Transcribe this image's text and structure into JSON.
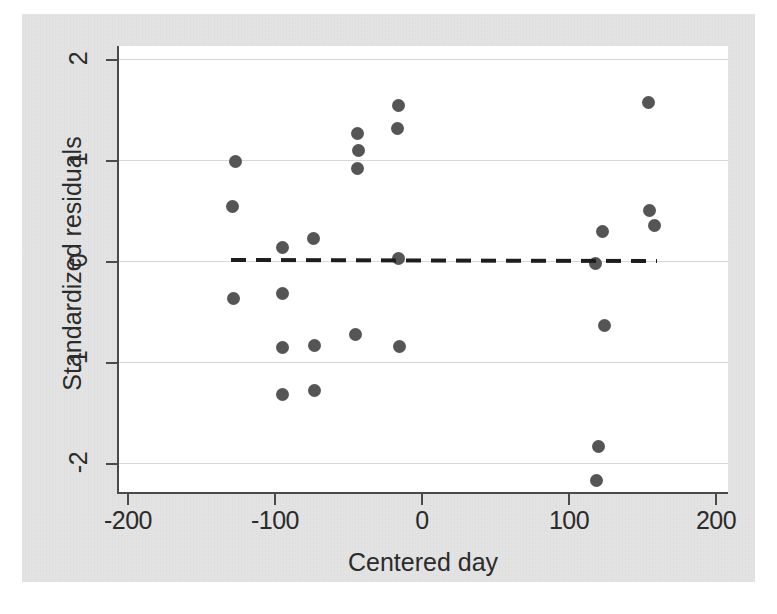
{
  "chart_data": {
    "type": "scatter",
    "title": "",
    "xlabel": "Centered day",
    "ylabel": "Standardized residuals",
    "xlim": [
      -220,
      207
    ],
    "ylim": [
      -2.33,
      2.16
    ],
    "xticks": [
      -200,
      -100,
      0,
      100,
      200
    ],
    "xticklabels": [
      "-200",
      "-100",
      "0",
      "100",
      "200"
    ],
    "yticks": [
      -2,
      -1,
      0,
      1,
      2
    ],
    "yticklabels": [
      "-2",
      "-1",
      "0",
      "1",
      "2"
    ],
    "grid": "horizontal-only",
    "legend": "none",
    "marker_color": "#555555",
    "grid_color": "#d8d8d8",
    "axis_color": "#4a4a4a",
    "panel_color": "#ffffff",
    "background_color": "#e4e4e4",
    "points": [
      {
        "x": -129,
        "y": 0.55
      },
      {
        "x": -127,
        "y": 0.99
      },
      {
        "x": -128,
        "y": -0.36
      },
      {
        "x": -95,
        "y": 0.14
      },
      {
        "x": -95,
        "y": -0.31
      },
      {
        "x": -95,
        "y": -0.85
      },
      {
        "x": -95,
        "y": -1.31
      },
      {
        "x": -74,
        "y": 0.23
      },
      {
        "x": -73,
        "y": -0.83
      },
      {
        "x": -73,
        "y": -1.28
      },
      {
        "x": -44,
        "y": 1.27
      },
      {
        "x": -43,
        "y": 1.1
      },
      {
        "x": -44,
        "y": 0.92
      },
      {
        "x": -45,
        "y": -0.72
      },
      {
        "x": -16,
        "y": 1.55
      },
      {
        "x": -17,
        "y": 1.32
      },
      {
        "x": -16,
        "y": 0.03
      },
      {
        "x": -15,
        "y": -0.84
      },
      {
        "x": 118,
        "y": -0.02
      },
      {
        "x": 123,
        "y": 0.3
      },
      {
        "x": 124,
        "y": -0.63
      },
      {
        "x": 120,
        "y": -1.83
      },
      {
        "x": 119,
        "y": -2.17
      },
      {
        "x": 154,
        "y": 1.58
      },
      {
        "x": 155,
        "y": 0.51
      },
      {
        "x": 158,
        "y": 0.36
      }
    ],
    "fit_line": {
      "style": "dashed",
      "color": "#1d1d1d",
      "x_start": -130,
      "y_start": 0.02,
      "x_end": 160,
      "y_end": 0.01
    }
  }
}
